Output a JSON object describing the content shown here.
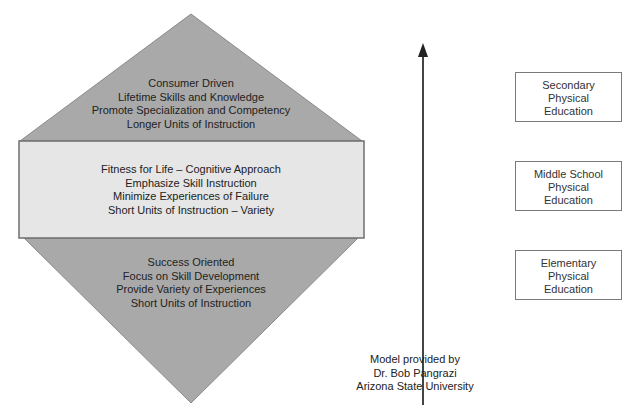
{
  "diagram": {
    "colors": {
      "triangle_fill": "#a9a9a9",
      "band_fill": "#e6e6e6",
      "outline": "#6f6f6f",
      "arrow": "#222222",
      "box_border": "#7a7a7a"
    },
    "top_section": {
      "lines": [
        "Consumer Driven",
        "Lifetime Skills and Knowledge",
        "Promote Specialization and Competency",
        "Longer Units of Instruction"
      ]
    },
    "middle_section": {
      "lines": [
        "Fitness for Life – Cognitive Approach",
        "Emphasize Skill Instruction",
        "Minimize Experiences of Failure",
        "Short Units of Instruction – Variety"
      ]
    },
    "bottom_section": {
      "lines": [
        "Success Oriented",
        "Focus on Skill Development",
        "Provide Variety of Experiences",
        "Short Units of Instruction"
      ]
    },
    "credit": {
      "lines": [
        "Model provided by",
        "Dr. Bob Pangrazi",
        "Arizona State University"
      ]
    },
    "levels": [
      {
        "lines": [
          "Secondary",
          "Physical",
          "Education"
        ]
      },
      {
        "lines": [
          "Middle School",
          "Physical",
          "Education"
        ]
      },
      {
        "lines": [
          "Elementary",
          "Physical",
          "Education"
        ]
      }
    ],
    "arrow": {
      "direction": "up",
      "icon": "arrow-up-icon"
    },
    "caption_partial": ""
  }
}
